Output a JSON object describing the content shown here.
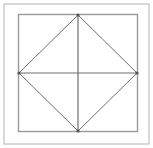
{
  "canvas": {
    "width": 153,
    "height": 148,
    "background_color": "#ffffff",
    "title": "Square with inscribed diamond and diagonals"
  },
  "colors": {
    "outer_frame_stroke": "#b4b4b4",
    "inner_square_stroke": "#9a9a9a",
    "diamond_stroke": "#6e6e6e",
    "axis_line_stroke": "#6e6e6e",
    "vertex_dot_fill": "#555555",
    "background": "#ffffff"
  },
  "strokes": {
    "outer_frame_width": 1,
    "inner_square_width": 1.4,
    "diamond_width": 1,
    "axis_line_width": 1.2,
    "vertex_dot_radius": 1.6
  },
  "shapes": {
    "outer_frame": {
      "label": "outer frame",
      "x": 4,
      "y": 4,
      "width": 145,
      "height": 140
    },
    "inner_square": {
      "label": "inner square",
      "x": 18.5,
      "y": 14.5,
      "width": 119,
      "height": 117
    },
    "diamond": {
      "label": "inscribed diamond",
      "points": "78,15 137,73 78,131 19,73",
      "vertices": [
        {
          "name": "top",
          "x": 78,
          "y": 15
        },
        {
          "name": "right",
          "x": 137,
          "y": 73
        },
        {
          "name": "bottom",
          "x": 78,
          "y": 131
        },
        {
          "name": "left",
          "x": 19,
          "y": 73
        }
      ]
    },
    "vertical_axis": {
      "label": "vertical center line",
      "x1": 78,
      "y1": 15,
      "x2": 78,
      "y2": 131
    },
    "horizontal_axis": {
      "label": "horizontal center line",
      "x1": 19,
      "y1": 73,
      "x2": 137,
      "y2": 73
    }
  }
}
